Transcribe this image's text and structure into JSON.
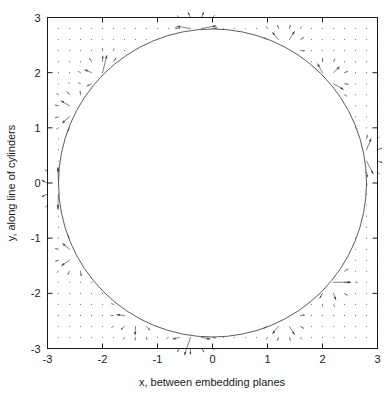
{
  "figure": {
    "background": "#ffffff",
    "ink_color": "#1a1a1a",
    "vector_color": "#3a3a3a",
    "circle_color": "#4a4a4a"
  },
  "chart_data": {
    "type": "scatter",
    "subtype": "vector-field-quiver",
    "title": "",
    "xlabel": "x, between embedding planes",
    "ylabel": "y, along line of cylinders",
    "xlim": [
      -3,
      3
    ],
    "ylim": [
      -3,
      3
    ],
    "xticks": [
      -3,
      -2,
      -1,
      0,
      1,
      2,
      3
    ],
    "yticks": [
      -3,
      -2,
      -1,
      0,
      1,
      2,
      3
    ],
    "xticklabels": [
      "-3",
      "-2",
      "-1",
      "0",
      "1",
      "2",
      "3"
    ],
    "yticklabels": [
      "-3",
      "-2",
      "-1",
      "0",
      "1",
      "2",
      "3"
    ],
    "grid": false,
    "legend": null,
    "frame": "full-box",
    "tick_direction": "in",
    "aspect": "equal",
    "annotations": [],
    "circle": {
      "center": [
        0,
        0
      ],
      "radius": 2.8,
      "stroke": "#4a4a4a",
      "stroke_width": 0.9,
      "filled": false,
      "description": "interface circle; vector field drawn only outside it, interior blank"
    },
    "field": {
      "grid_nx": 31,
      "grid_ny": 31,
      "grid_x_start": -3.0,
      "grid_x_end": 3.0,
      "grid_y_start": -3.0,
      "grid_y_end": 3.0,
      "masked_inside_radius": 2.78,
      "arrow_style": "thin line with small head",
      "max_arrow_length": 0.42,
      "dot_threshold": 0.035,
      "description": "arrows radiate from and converge toward singular points located on the circle; magnitude decays with distance from circle and from nearest singular point"
    },
    "singular_points": [
      {
        "angle_deg": 10,
        "x": 2.757,
        "y": 0.486,
        "type": "source"
      },
      {
        "angle_deg": 42,
        "x": 2.081,
        "y": 1.873,
        "type": "source"
      },
      {
        "angle_deg": 62,
        "x": 1.315,
        "y": 2.472,
        "type": "source"
      },
      {
        "angle_deg": 96,
        "x": -0.293,
        "y": 2.785,
        "type": "source"
      },
      {
        "angle_deg": 136,
        "x": -2.014,
        "y": 1.945,
        "type": "source"
      },
      {
        "angle_deg": 152,
        "x": -2.472,
        "y": 1.315,
        "type": "source"
      },
      {
        "angle_deg": 182,
        "x": -2.798,
        "y": -0.098,
        "type": "source"
      },
      {
        "angle_deg": 208,
        "x": -2.472,
        "y": -1.315,
        "type": "source"
      },
      {
        "angle_deg": 240,
        "x": -1.4,
        "y": -2.425,
        "type": "source"
      },
      {
        "angle_deg": 262,
        "x": -0.39,
        "y": -2.773,
        "type": "source"
      },
      {
        "angle_deg": 298,
        "x": 1.315,
        "y": -2.472,
        "type": "source"
      },
      {
        "angle_deg": 320,
        "x": 2.145,
        "y": -1.8,
        "type": "source"
      }
    ]
  },
  "axes": {
    "x_axis_label": "x, between embedding planes",
    "y_axis_label": "y, along line of cylinders"
  }
}
